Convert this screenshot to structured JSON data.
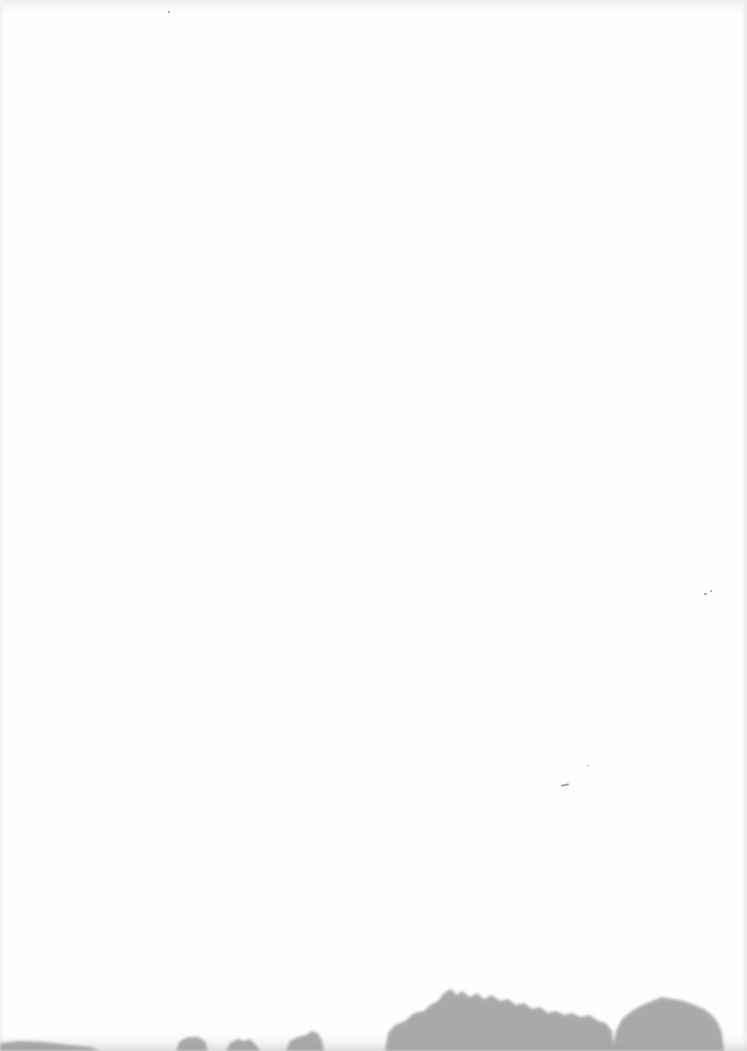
{
  "scene": {
    "description": "Mostly blank off-white page with a faint misty tree line along the bottom edge",
    "background_color": "#fefefe",
    "treeline_color": "#8f8f8f",
    "haze_color": "#d6d6d6"
  }
}
